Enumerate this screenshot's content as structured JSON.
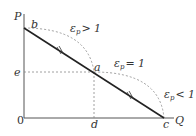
{
  "diagram": {
    "axes": {
      "y_label": "P",
      "x_label": "Q",
      "origin_label": "0"
    },
    "points": {
      "b": "b",
      "a": "a",
      "c": "c",
      "d": "d",
      "e": "e"
    },
    "regions": {
      "elastic": {
        "symbol": "ε",
        "sub": "p",
        "relation": "> 1"
      },
      "unit": {
        "symbol": "ε",
        "sub": "p",
        "relation": "= 1"
      },
      "inelastic": {
        "symbol": "ε",
        "sub": "p",
        "relation": "< 1"
      }
    },
    "colors": {
      "line": "#222222",
      "dashed": "#888888",
      "axis": "#555555"
    }
  }
}
